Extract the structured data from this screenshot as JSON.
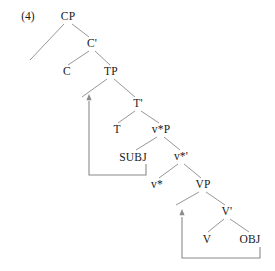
{
  "figure": {
    "example_number": "(4)",
    "type": "x-bar-syntax-tree",
    "line_color": "#8a8a8a",
    "text_color": "#1a1a1a",
    "background_color": "#ffffff"
  },
  "nodes": [
    {
      "id": "CP",
      "label": "CP",
      "x": 68,
      "y": 17
    },
    {
      "id": "Cbar",
      "label": "C'",
      "x": 92,
      "y": 44
    },
    {
      "id": "C",
      "label": "C",
      "x": 67,
      "y": 72
    },
    {
      "id": "TP",
      "label": "TP",
      "x": 111,
      "y": 72
    },
    {
      "id": "Tbar",
      "label": "T'",
      "x": 138,
      "y": 104
    },
    {
      "id": "T",
      "label": "T",
      "x": 117,
      "y": 130
    },
    {
      "id": "vP",
      "label": "v*P",
      "x": 161,
      "y": 130
    },
    {
      "id": "SUBJ",
      "label": "SUBJ",
      "x": 133,
      "y": 158
    },
    {
      "id": "vbar",
      "label": "v*'",
      "x": 181,
      "y": 157
    },
    {
      "id": "v",
      "label": "v*",
      "x": 157,
      "y": 185
    },
    {
      "id": "VP",
      "label": "VP",
      "x": 203,
      "y": 185
    },
    {
      "id": "Vbar",
      "label": "V'",
      "x": 227,
      "y": 212
    },
    {
      "id": "V",
      "label": "V",
      "x": 207,
      "y": 240
    },
    {
      "id": "OBJ",
      "label": "OBJ",
      "x": 250,
      "y": 240
    }
  ],
  "branches": [
    {
      "from": "CP",
      "to": "C",
      "x1": 64,
      "y1": 24,
      "x2": 30,
      "y2": 60
    },
    {
      "from": "CP",
      "to": "Cbar",
      "x1": 72,
      "y1": 24,
      "x2": 89,
      "y2": 37
    },
    {
      "from": "Cbar",
      "to": "C",
      "x1": 89,
      "y1": 51,
      "x2": 68,
      "y2": 65
    },
    {
      "from": "Cbar",
      "to": "TP",
      "x1": 95,
      "y1": 51,
      "x2": 110,
      "y2": 65
    },
    {
      "from": "TP",
      "to": "left",
      "x1": 107,
      "y1": 79,
      "x2": 82,
      "y2": 97
    },
    {
      "from": "TP",
      "to": "Tbar",
      "x1": 114,
      "y1": 79,
      "x2": 135,
      "y2": 97
    },
    {
      "from": "Tbar",
      "to": "T",
      "x1": 135,
      "y1": 111,
      "x2": 118,
      "y2": 123
    },
    {
      "from": "Tbar",
      "to": "vP",
      "x1": 141,
      "y1": 111,
      "x2": 159,
      "y2": 123
    },
    {
      "from": "vP",
      "to": "SUBJ",
      "x1": 157,
      "y1": 137,
      "x2": 136,
      "y2": 150
    },
    {
      "from": "vP",
      "to": "vbar",
      "x1": 164,
      "y1": 137,
      "x2": 180,
      "y2": 150
    },
    {
      "from": "vbar",
      "to": "v",
      "x1": 178,
      "y1": 164,
      "x2": 159,
      "y2": 178
    },
    {
      "from": "vbar",
      "to": "VP",
      "x1": 184,
      "y1": 164,
      "x2": 201,
      "y2": 178
    },
    {
      "from": "VP",
      "to": "left",
      "x1": 199,
      "y1": 192,
      "x2": 176,
      "y2": 205
    },
    {
      "from": "VP",
      "to": "Vbar",
      "x1": 206,
      "y1": 192,
      "x2": 225,
      "y2": 205
    },
    {
      "from": "Vbar",
      "to": "V",
      "x1": 224,
      "y1": 219,
      "x2": 208,
      "y2": 232
    },
    {
      "from": "Vbar",
      "to": "OBJ",
      "x1": 230,
      "y1": 219,
      "x2": 249,
      "y2": 232
    }
  ],
  "movements": [
    {
      "id": "subject-raising",
      "description": "SUBJ raises to specifier of TP",
      "source_node": "SUBJ",
      "target_node": "TP",
      "path": "M 146 164 L 146 175 L 89 175 L 89 101",
      "arrowhead": {
        "x": 89,
        "y": 98
      }
    },
    {
      "id": "object-raising",
      "description": "OBJ raises to specifier of VP",
      "source_node": "OBJ",
      "target_node": "VP",
      "path": "M 260 247 L 260 258 L 182 258 L 182 217",
      "arrowhead": {
        "x": 182,
        "y": 213
      }
    }
  ],
  "chart_data": {
    "type": "diagram",
    "title": "(4)",
    "diagram_kind": "phrase-structure-tree",
    "root": "CP",
    "terminals": [
      "C",
      "T",
      "SUBJ",
      "v*",
      "V",
      "OBJ"
    ],
    "projections": [
      "CP",
      "C'",
      "TP",
      "T'",
      "v*P",
      "v*'",
      "VP",
      "V'"
    ],
    "movement_count": 2
  }
}
